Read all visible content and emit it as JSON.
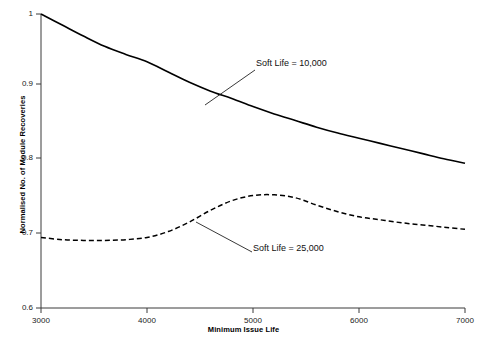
{
  "figure": {
    "background": "#ffffff",
    "ink_color": "#000000"
  },
  "axes": {
    "x_title": "Minimum Issue Life",
    "y_title": "Normalised No. of Module Recoveries",
    "x_ticks": [
      "3000",
      "4000",
      "5000",
      "6000",
      "7000"
    ],
    "y_ticks": [
      "1",
      "0.9",
      "0.8",
      "0.7",
      "0.6"
    ]
  },
  "annotations": {
    "soft_life_10000": "Soft Life = 10,000",
    "soft_life_25000": "Soft Life = 25,000"
  },
  "chart_data": {
    "type": "line",
    "title": "",
    "xlabel": "Minimum Issue Life",
    "ylabel": "Normalised No. of Module Recoveries",
    "xlim": [
      3000,
      7000
    ],
    "ylim": [
      0.6,
      1.0
    ],
    "xticks": [
      3000,
      4000,
      5000,
      6000,
      7000
    ],
    "yticks": [
      0.6,
      0.7,
      0.8,
      0.9,
      1.0
    ],
    "grid": false,
    "legend": "inline-annotations",
    "series": [
      {
        "name": "Soft Life = 10,000",
        "style": "solid",
        "color": "#000000",
        "x": [
          3000,
          3200,
          3400,
          3600,
          3800,
          4000,
          4200,
          4400,
          4600,
          4800,
          5000,
          5200,
          5400,
          5600,
          5800,
          6000,
          6200,
          6400,
          6600,
          6800,
          7000
        ],
        "y": [
          1.0,
          0.985,
          0.97,
          0.956,
          0.945,
          0.935,
          0.921,
          0.907,
          0.895,
          0.885,
          0.874,
          0.864,
          0.855,
          0.846,
          0.838,
          0.831,
          0.824,
          0.817,
          0.81,
          0.803,
          0.797
        ]
      },
      {
        "name": "Soft Life = 25,000",
        "style": "dashed",
        "color": "#000000",
        "x": [
          3000,
          3200,
          3400,
          3600,
          3800,
          4000,
          4200,
          4400,
          4600,
          4800,
          5000,
          5200,
          5400,
          5600,
          5800,
          6000,
          6200,
          6400,
          6600,
          6800,
          7000
        ],
        "y": [
          0.696,
          0.693,
          0.692,
          0.692,
          0.693,
          0.696,
          0.704,
          0.717,
          0.733,
          0.746,
          0.753,
          0.754,
          0.75,
          0.74,
          0.731,
          0.724,
          0.72,
          0.716,
          0.713,
          0.71,
          0.707
        ]
      }
    ],
    "annotations": [
      {
        "text": "Soft Life = 10,000",
        "points_to": [
          4550,
          0.872
        ],
        "label_at": [
          5000,
          0.925
        ]
      },
      {
        "text": "Soft Life = 25,000",
        "points_to": [
          4460,
          0.718
        ],
        "label_at": [
          5000,
          0.645
        ]
      }
    ]
  }
}
